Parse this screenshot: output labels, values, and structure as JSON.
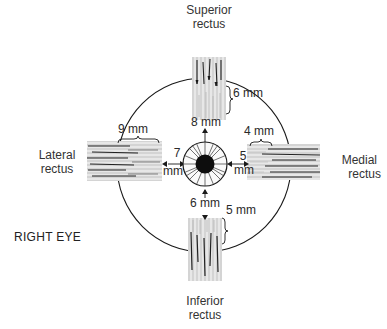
{
  "diagram": {
    "eye_label": "RIGHT EYE",
    "muscles": [
      {
        "id": "superior",
        "name_line1": "Superior",
        "name_line2": "rectus",
        "insertion_width": "6 mm",
        "distance_from_limbus_value": "8",
        "distance_from_limbus_unit": "mm"
      },
      {
        "id": "lateral",
        "name_line1": "Lateral",
        "name_line2": "rectus",
        "insertion_width": "9 mm",
        "distance_from_limbus_value": "7",
        "distance_from_limbus_unit": "mm"
      },
      {
        "id": "medial",
        "name_line1": "Medial",
        "name_line2": "rectus",
        "insertion_width": "4 mm",
        "distance_from_limbus_value": "5",
        "distance_from_limbus_unit": "mm"
      },
      {
        "id": "inferior",
        "name_line1": "Inferior",
        "name_line2": "rectus",
        "insertion_width": "5 mm",
        "distance_from_limbus_value": "6",
        "distance_from_limbus_unit": "mm"
      }
    ],
    "colors": {
      "ink": "#1a1a1a",
      "background": "#ffffff",
      "label": "#333333"
    }
  }
}
